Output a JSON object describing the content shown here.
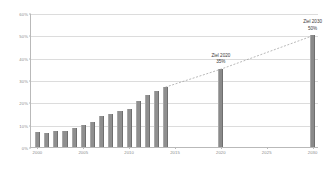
{
  "chart_data": {
    "type": "bar",
    "title": "",
    "subtitle": "",
    "xlabel": "",
    "ylabel": "",
    "xlim": [
      1999.3,
      2030.7
    ],
    "ylim": [
      0,
      60
    ],
    "grid": true,
    "legend": false,
    "y_ticks": [
      "0%",
      "10%",
      "20%",
      "30%",
      "40%",
      "50%",
      "60%"
    ],
    "y_tick_values": [
      0,
      10,
      20,
      30,
      40,
      50,
      60
    ],
    "x_ticks": [
      "2000",
      "2005",
      "2010",
      "2015",
      "2020",
      "2025",
      "2030"
    ],
    "x_tick_values": [
      2000,
      2005,
      2010,
      2015,
      2020,
      2025,
      2030
    ],
    "categories": [
      2000,
      2001,
      2002,
      2003,
      2004,
      2005,
      2006,
      2007,
      2008,
      2009,
      2010,
      2011,
      2012,
      2013,
      2014,
      2020,
      2030
    ],
    "values": [
      6.5,
      6.4,
      7.3,
      7.2,
      8.5,
      10.0,
      11.3,
      14.0,
      15.0,
      16.0,
      16.8,
      20.5,
      23.5,
      25.0,
      27.0,
      35.0,
      50.0
    ],
    "series": [
      {
        "name": "Anteil",
        "values": [
          6.5,
          6.4,
          7.3,
          7.2,
          8.5,
          10.0,
          11.3,
          14.0,
          15.0,
          16.0,
          16.8,
          20.5,
          23.5,
          25.0,
          27.0,
          35.0,
          50.0
        ]
      }
    ],
    "trend_line": {
      "style": "dotted",
      "x": [
        2014,
        2020,
        2030
      ],
      "y": [
        27.0,
        35.0,
        50.0
      ]
    },
    "annotations": [
      {
        "label": "Ziel 2020",
        "value": "35%",
        "x": 2020,
        "y": 35
      },
      {
        "label": "Ziel 2030",
        "value": "50%",
        "x": 2030,
        "y": 50
      }
    ],
    "colors": {
      "bar": "#8f8f8f",
      "grid": "#dcdcdc",
      "axis": "#b9b9b9",
      "tick_text": "#8a8a8a",
      "annotation_text": "#3a3a3a",
      "trend": "#9a9a9a"
    }
  }
}
